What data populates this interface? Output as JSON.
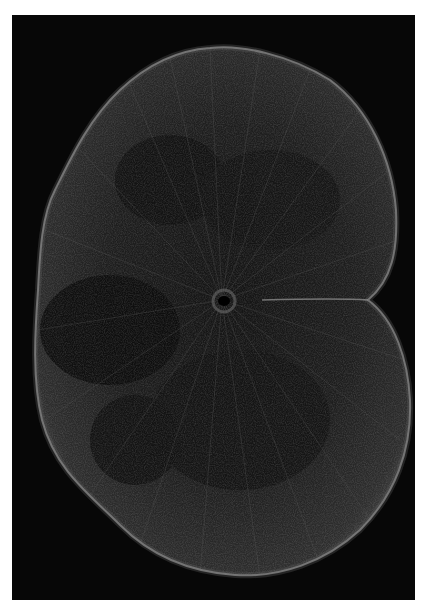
{
  "image": {
    "subject": "spinal cord cross-section (fluorescence micrograph)",
    "background_color": "#ffffff",
    "frame_color": "#070707",
    "tissue_color": "#1c1c1c",
    "edge_color": "#9a9a9a",
    "fiber_color": "#6a6a6a",
    "canal_color": "#000000"
  }
}
